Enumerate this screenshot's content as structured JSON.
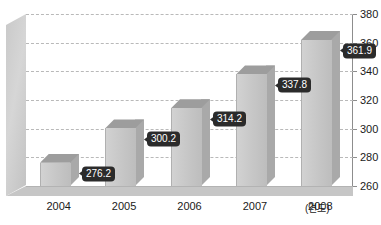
{
  "chart_data": {
    "type": "bar",
    "title": "",
    "subtitle": "",
    "xlabel": "(연도)",
    "ylabel": "",
    "categories": [
      "2004",
      "2005",
      "2006",
      "2007",
      "2008"
    ],
    "values": [
      276.2,
      300.2,
      314.2,
      337.8,
      361.9
    ],
    "value_labels": [
      "276.2",
      "300.2",
      "314.2",
      "337.8",
      "361.9"
    ],
    "ylim": [
      260,
      380
    ],
    "yticks": [
      260,
      280,
      300,
      320,
      340,
      360,
      380
    ],
    "ytick_labels": [
      "260",
      "280",
      "300",
      "320",
      "340",
      "360",
      "380"
    ],
    "grid": true,
    "grid_style": "dashed-horizontal",
    "legend": null,
    "legend_position": "none",
    "axis_position": "right",
    "style": "3d-column",
    "series": [
      {
        "name": "",
        "values": [
          276.2,
          300.2,
          314.2,
          337.8,
          361.9
        ]
      }
    ]
  },
  "colors": {
    "bar_front": "#c6c6c6",
    "bar_top": "#9d9d9d",
    "bar_side": "#a9a9a9",
    "wall": "#cccccc",
    "floor": "#c6c6c6",
    "grid": "#b9b9b9",
    "axis": "#8d8d8d",
    "callout_bg": "#2b2b2b",
    "callout_text": "#ffffff",
    "text": "#1a1a1a",
    "background": "#ffffff"
  }
}
